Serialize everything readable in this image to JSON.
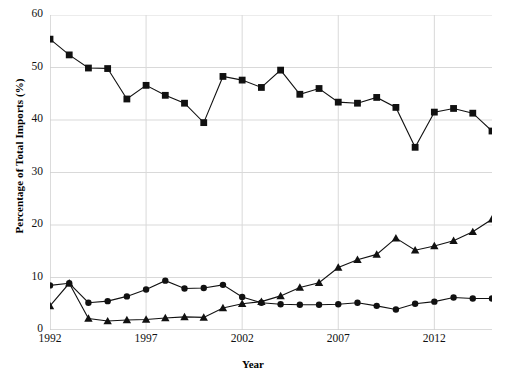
{
  "chart_data": {
    "type": "line",
    "title": "",
    "xlabel": "Year",
    "ylabel": "Percentage of Total Imports (%)",
    "xlim": [
      1992,
      2015
    ],
    "ylim": [
      0,
      60
    ],
    "grid": true,
    "legend": "none",
    "xtick_labels": [
      "1992",
      "1997",
      "2002",
      "2007",
      "2012"
    ],
    "xtick_values": [
      1992,
      1997,
      2002,
      2007,
      2012
    ],
    "ytick_labels": [
      "0",
      "10",
      "20",
      "30",
      "40",
      "50",
      "60"
    ],
    "ytick_values": [
      0,
      10,
      20,
      30,
      40,
      50,
      60
    ],
    "x": [
      1992,
      1993,
      1994,
      1995,
      1996,
      1997,
      1998,
      1999,
      2000,
      2001,
      2002,
      2003,
      2004,
      2005,
      2006,
      2007,
      2008,
      2009,
      2010,
      2011,
      2012,
      2013,
      2014,
      2015
    ],
    "series": [
      {
        "name": "series-squares",
        "marker": "square",
        "color": "#111111",
        "values": [
          55.4,
          52.4,
          49.9,
          49.8,
          44.0,
          46.6,
          44.7,
          43.2,
          39.5,
          48.3,
          47.6,
          46.2,
          49.5,
          44.9,
          46.0,
          43.4,
          43.2,
          44.3,
          42.4,
          34.8,
          41.5,
          42.2,
          41.3,
          37.9
        ]
      },
      {
        "name": "series-circles",
        "marker": "circle",
        "color": "#111111",
        "values": [
          8.5,
          8.9,
          5.2,
          5.5,
          6.4,
          7.7,
          9.4,
          7.9,
          8.0,
          8.6,
          6.3,
          5.2,
          4.9,
          4.8,
          4.8,
          4.9,
          5.2,
          4.6,
          3.9,
          5.0,
          5.4,
          6.2,
          6.0,
          6.0
        ]
      },
      {
        "name": "series-triangles",
        "marker": "triangle",
        "color": "#111111",
        "values": [
          4.6,
          8.9,
          2.2,
          1.7,
          1.9,
          2.0,
          2.3,
          2.5,
          2.4,
          4.2,
          5.0,
          5.4,
          6.5,
          8.1,
          9.0,
          11.9,
          13.4,
          14.4,
          17.5,
          15.2,
          16.0,
          17.0,
          18.7,
          21.1
        ]
      }
    ]
  },
  "axes": {
    "ylabel": "Percentage of Total Imports (%)",
    "xlabel": "Year"
  }
}
